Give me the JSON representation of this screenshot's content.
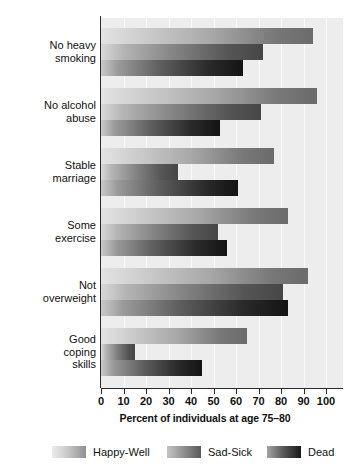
{
  "chart_data": {
    "type": "bar",
    "orientation": "horizontal",
    "title": "",
    "xlabel": "Percent of individuals at age 75–80",
    "ylabel": "Characteristic at age 50",
    "xlim": [
      0,
      100
    ],
    "xticks": [
      0,
      10,
      20,
      30,
      40,
      50,
      60,
      70,
      80,
      90,
      100
    ],
    "xticklabels": [
      "0",
      "10",
      "20",
      "30",
      "40",
      "50",
      "60",
      "70",
      "80",
      "90",
      "100"
    ],
    "grid": true,
    "grid_axis": "x",
    "legend_position": "bottom",
    "categories": [
      "No heavy\nsmoking",
      "No alcohol\nabuse",
      "Stable\nmarriage",
      "Some\nexercise",
      "Not\noverweight",
      "Good\ncoping\nskills"
    ],
    "series": [
      {
        "name": "Happy-Well",
        "color": "#8f8f8f",
        "values": [
          94,
          96,
          77,
          83,
          92,
          65
        ]
      },
      {
        "name": "Sad-Sick",
        "color": "#5a5a5a",
        "values": [
          72,
          71,
          34,
          52,
          81,
          15
        ]
      },
      {
        "name": "Dead",
        "color": "#181818",
        "values": [
          63,
          53,
          61,
          56,
          83,
          45
        ]
      }
    ]
  },
  "legend": {
    "items": [
      {
        "label": "Happy-Well",
        "swatch": "happy-well-swatch"
      },
      {
        "label": "Sad-Sick",
        "swatch": "sad-sick-swatch"
      },
      {
        "label": "Dead",
        "swatch": "dead-swatch"
      }
    ]
  }
}
